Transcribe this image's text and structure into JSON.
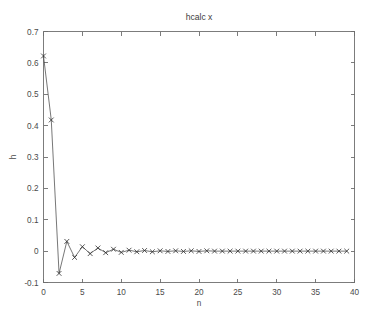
{
  "figure": {
    "title": "hcalc x",
    "background_color": "#ffffff",
    "axis_color": "#6e6e6e",
    "line_color": "#4a4a4a",
    "marker_color": "#2e2e2e",
    "marker_style": "x"
  },
  "chart_data": {
    "type": "line",
    "title": "hcalc x",
    "xlabel": "n",
    "ylabel": "h",
    "xlim": [
      0,
      40
    ],
    "ylim": [
      -0.1,
      0.7
    ],
    "grid": false,
    "legend": null,
    "marker": "x",
    "xticks": [
      0,
      5,
      10,
      15,
      20,
      25,
      30,
      35,
      40
    ],
    "xtick_labels": [
      "0",
      "5",
      "10",
      "15",
      "20",
      "25",
      "30",
      "35",
      "40"
    ],
    "yticks": [
      -0.1,
      0,
      0.1,
      0.2,
      0.3,
      0.4,
      0.5,
      0.6,
      0.7
    ],
    "ytick_labels": [
      "-0.1",
      "0",
      "0.1",
      "0.2",
      "0.3",
      "0.4",
      "0.5",
      "0.6",
      "0.7"
    ],
    "x": [
      0,
      1,
      2,
      3,
      4,
      5,
      6,
      7,
      8,
      9,
      10,
      11,
      12,
      13,
      14,
      15,
      16,
      17,
      18,
      19,
      20,
      21,
      22,
      23,
      24,
      25,
      26,
      27,
      28,
      29,
      30,
      31,
      32,
      33,
      34,
      35,
      36,
      37,
      38,
      39
    ],
    "values": [
      0.622,
      0.418,
      -0.071,
      0.031,
      -0.02,
      0.014,
      -0.008,
      0.01,
      -0.005,
      0.006,
      -0.004,
      0.003,
      -0.002,
      0.002,
      -0.002,
      0.001,
      -0.001,
      0.001,
      -0.001,
      0.001,
      -0.001,
      0.001,
      0.0,
      0.0,
      0.0,
      0.0,
      0.0,
      0.0,
      0.0,
      0.0,
      0.0,
      0.0,
      0.0,
      0.0,
      0.0,
      0.0,
      0.0,
      0.0,
      0.0,
      0.0
    ],
    "series": [
      {
        "name": "h",
        "values": [
          0.622,
          0.418,
          -0.071,
          0.031,
          -0.02,
          0.014,
          -0.008,
          0.01,
          -0.005,
          0.006,
          -0.004,
          0.003,
          -0.002,
          0.002,
          -0.002,
          0.001,
          -0.001,
          0.001,
          -0.001,
          0.001,
          -0.001,
          0.001,
          0.0,
          0.0,
          0.0,
          0.0,
          0.0,
          0.0,
          0.0,
          0.0,
          0.0,
          0.0,
          0.0,
          0.0,
          0.0,
          0.0,
          0.0,
          0.0,
          0.0,
          0.0
        ]
      }
    ]
  }
}
